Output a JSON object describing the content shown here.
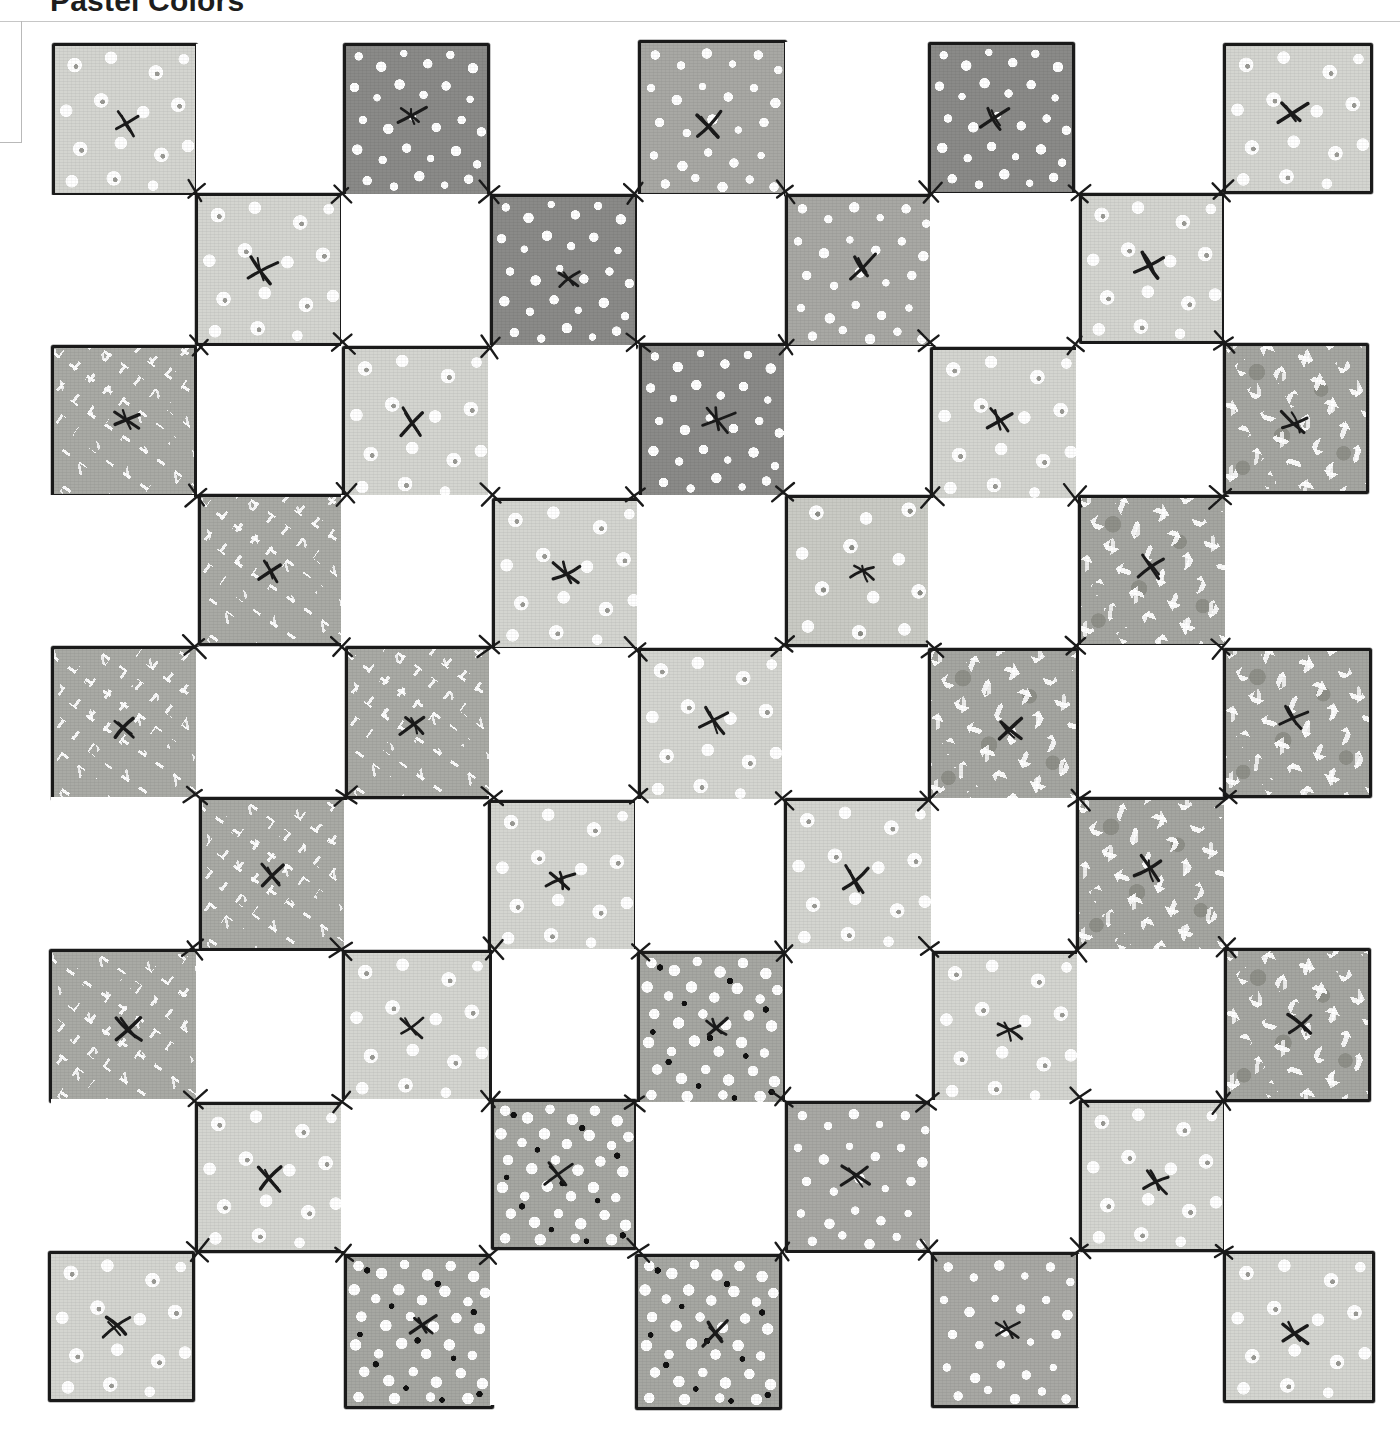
{
  "header": {
    "title": "Pastel Colors",
    "frame_name": "title-frame"
  },
  "artwork": {
    "subject": "patchwork-quilt",
    "description": "Hand-drawn checkerboard patchwork quilt of nine by nine squares alternating printed fabric patches and plain white patches, each printed patch marked with an inked X hand-stitch at its centre.",
    "grid": {
      "rows": 9,
      "columns": 9,
      "cell_width": 146.7,
      "cell_height": 151.3
    },
    "palette": {
      "ink": "#1a1a1a",
      "blank": "#ffffff",
      "floral_light": "#d4d5d0",
      "floral_mid": "#c9cac4",
      "confetti_dark": "#8a8a88",
      "confetti_mid": "#a8a8a4",
      "dashes": "#a9aaa5",
      "brush": "#a5a6a1",
      "pebbles": "#a6a7a2",
      "rule": "#c6c6c6",
      "frame_border": "#b9b9b9"
    },
    "fabric_names": {
      "blank": "plain-white",
      "floral_light": "light-floral-print",
      "floral_mid": "mid-floral-print",
      "confetti_dark": "dark-confetti-print",
      "confetti_mid": "mid-confetti-print",
      "dashes": "white-dash-print",
      "brush": "brushstroke-print",
      "pebbles": "pebble-dot-print"
    },
    "cells": [
      [
        "floral_light",
        "blank",
        "confetti_dark",
        "blank",
        "confetti_mid",
        "blank",
        "confetti_dark",
        "blank",
        "floral_light"
      ],
      [
        "blank",
        "floral_light",
        "blank",
        "confetti_dark",
        "blank",
        "confetti_mid",
        "blank",
        "floral_light",
        "blank"
      ],
      [
        "dashes",
        "blank",
        "floral_light",
        "blank",
        "confetti_dark",
        "blank",
        "floral_light",
        "blank",
        "brush"
      ],
      [
        "blank",
        "dashes",
        "blank",
        "floral_light",
        "blank",
        "floral_mid",
        "blank",
        "brush",
        "blank"
      ],
      [
        "dashes",
        "blank",
        "dashes",
        "blank",
        "floral_light",
        "blank",
        "brush",
        "blank",
        "brush"
      ],
      [
        "blank",
        "dashes",
        "blank",
        "floral_light",
        "blank",
        "floral_light",
        "blank",
        "brush",
        "blank"
      ],
      [
        "dashes",
        "blank",
        "floral_light",
        "blank",
        "pebbles",
        "blank",
        "floral_light",
        "blank",
        "brush"
      ],
      [
        "blank",
        "floral_light",
        "blank",
        "pebbles",
        "blank",
        "confetti_mid",
        "blank",
        "floral_light",
        "blank"
      ],
      [
        "floral_light",
        "blank",
        "pebbles",
        "blank",
        "pebbles",
        "blank",
        "confetti_mid",
        "blank",
        "floral_light"
      ]
    ]
  }
}
